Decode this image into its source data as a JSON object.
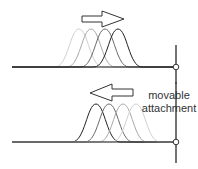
{
  "diagram": {
    "top_panel": {
      "arrow_direction": "right",
      "curves": [
        {
          "center_x": 79,
          "stroke": "#d0d0d0"
        },
        {
          "center_x": 91,
          "stroke": "#a8a8a8"
        },
        {
          "center_x": 105,
          "stroke": "#6a6a6a"
        },
        {
          "center_x": 118,
          "stroke": "#222222"
        }
      ]
    },
    "bottom_panel": {
      "arrow_direction": "left",
      "curves": [
        {
          "center_x": 96,
          "stroke": "#222222"
        },
        {
          "center_x": 109,
          "stroke": "#6a6a6a"
        },
        {
          "center_x": 123,
          "stroke": "#a8a8a8"
        },
        {
          "center_x": 136,
          "stroke": "#d0d0d0"
        }
      ]
    },
    "label": {
      "line1": "movable",
      "line2": "attachment"
    }
  }
}
